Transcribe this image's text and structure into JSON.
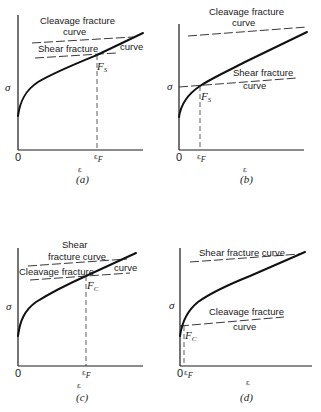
{
  "panels": {
    "a": {
      "caption": "(a)",
      "y_axis_label": "σ",
      "x_axis_label": "ε",
      "origin_label": "0",
      "strain_label": "ε",
      "strain_subscript": "F",
      "point_label": "F",
      "point_subscript": "S",
      "upper_line_text_1": "Cleavage fracture",
      "upper_line_text_2": "curve",
      "lower_line_text_1": "Shear fracture",
      "lower_line_text_2": "curve"
    },
    "b": {
      "caption": "(b)",
      "y_axis_label": "σ",
      "x_axis_label": "ε",
      "origin_label": "0",
      "strain_label": "ε",
      "strain_subscript": "F",
      "point_label": "F",
      "point_subscript": "S",
      "upper_line_text_1": "Cleavage fracture",
      "upper_line_text_2": "curve",
      "lower_line_text_1": "Shear fracture",
      "lower_line_text_2": "curve"
    },
    "c": {
      "caption": "(c)",
      "y_axis_label": "σ",
      "x_axis_label": "ε",
      "origin_label": "0",
      "strain_label": "ε",
      "strain_subscript": "F",
      "point_label": "F",
      "point_subscript": "C",
      "upper_line_text_1": "Shear",
      "upper_line_text_2": "fracture curve",
      "lower_line_text_1": "Cleavage fracture",
      "lower_line_text_2": "curve"
    },
    "d": {
      "caption": "(d)",
      "y_axis_label": "σ",
      "x_axis_label": "ε",
      "origin_label": "0",
      "strain_label": "ε",
      "strain_subscript": "F",
      "point_label": "F",
      "point_subscript": "C",
      "upper_line_text_1": "Shear fracture curve",
      "lower_line_text_1": "Cleavage fracture",
      "lower_line_text_2": "curve"
    }
  }
}
